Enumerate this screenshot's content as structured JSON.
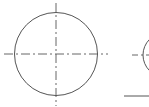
{
  "drawing": {
    "stroke_color": "#555555",
    "centerline_color": "#555555",
    "background": "#ffffff",
    "circles": [
      {
        "id": "circle-1",
        "cx": 56,
        "cy": 54,
        "r": 41.5,
        "centerlines": {
          "horizontal": {
            "x1": 4,
            "x2": 108,
            "y": 54
          },
          "vertical": {
            "y1": 3,
            "y2": 106,
            "x": 56
          }
        }
      },
      {
        "id": "circle-2-partial",
        "cx": 165,
        "cy": 55,
        "r": 22,
        "centerlines": {
          "horizontal": {
            "x1": 132,
            "x2": 149,
            "y": 55
          }
        }
      }
    ],
    "lines": [
      {
        "id": "baseline",
        "x1": 124,
        "y1": 96,
        "x2": 149,
        "y2": 96
      }
    ]
  }
}
